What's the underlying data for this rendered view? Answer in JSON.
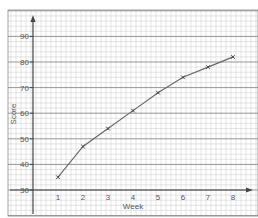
{
  "chart_data": {
    "type": "line",
    "title": "",
    "xlabel": "Week",
    "ylabel": "Score",
    "x": [
      1,
      2,
      3,
      4,
      5,
      6,
      7,
      8
    ],
    "categories": [
      "1",
      "2",
      "3",
      "4",
      "5",
      "6",
      "7",
      "8"
    ],
    "series": [
      {
        "name": "Score",
        "values": [
          35,
          47,
          54,
          61,
          68,
          74,
          78,
          82
        ],
        "marker": "x",
        "color": "#666666"
      }
    ],
    "x_ticks": [
      "1",
      "2",
      "3",
      "4",
      "5",
      "6",
      "7",
      "8"
    ],
    "y_ticks": [
      "30",
      "40",
      "50",
      "60",
      "70",
      "80",
      "90"
    ],
    "xlim": [
      0,
      9
    ],
    "ylim": [
      30,
      96
    ],
    "grid": true,
    "grid_style": "graph-paper",
    "legend": null
  },
  "colors": {
    "grid_minor": "#c8c8c8",
    "grid_major": "#8a8a8a",
    "axis": "#444444",
    "line": "#666666"
  }
}
